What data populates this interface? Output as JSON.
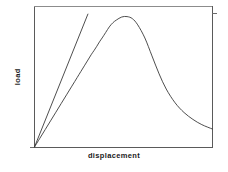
{
  "chart_data": {
    "type": "line",
    "title": "",
    "xlabel": "displacement",
    "ylabel": "load",
    "grid": false,
    "legend": null,
    "axis_ticks": {
      "x": [],
      "y": []
    },
    "axis_style": {
      "frame": "box",
      "line_color": "#555555",
      "curve_color": "#3a3a3a"
    },
    "xlim": [
      0,
      1
    ],
    "ylim": [
      0,
      1
    ],
    "series": [
      {
        "name": "load-displacement response",
        "description": "linear elastic rise, rounded peak, steep softening, long asymptotic tail",
        "x": [
          0.0,
          0.03,
          0.06,
          0.09,
          0.12,
          0.15,
          0.18,
          0.21,
          0.24,
          0.26,
          0.28,
          0.3,
          0.32,
          0.335,
          0.35,
          0.365,
          0.38,
          0.4,
          0.42,
          0.44,
          0.46,
          0.49,
          0.52,
          0.55,
          0.58,
          0.62,
          0.66,
          0.7,
          0.74,
          0.79,
          0.84,
          0.89,
          0.94,
          1.0
        ],
        "y": [
          0.0,
          0.063,
          0.126,
          0.189,
          0.252,
          0.315,
          0.378,
          0.441,
          0.504,
          0.546,
          0.588,
          0.63,
          0.672,
          0.7,
          0.73,
          0.762,
          0.79,
          0.83,
          0.87,
          0.9,
          0.92,
          0.942,
          0.945,
          0.93,
          0.885,
          0.79,
          0.66,
          0.53,
          0.42,
          0.32,
          0.25,
          0.2,
          0.162,
          0.13
        ]
      },
      {
        "name": "initial tangent (overshoot construction line)",
        "description": "straight line from origin continuing past the peak",
        "x": [
          0.0,
          0.3
        ],
        "y": [
          0.0,
          0.963
        ]
      }
    ]
  },
  "icons": {
    "axis_tick": "tick-mark"
  }
}
